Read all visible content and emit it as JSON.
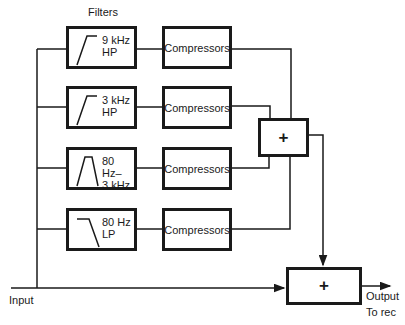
{
  "title": "Filters",
  "filters": [
    {
      "line1": "9 kHz",
      "line2": "HP",
      "shape": "highpass-icon"
    },
    {
      "line1": "3 kHz",
      "line2": "HP",
      "shape": "highpass-icon"
    },
    {
      "line1": "80 Hz–",
      "line2": "3 kHz",
      "shape": "bandpass-icon"
    },
    {
      "line1": "80 Hz",
      "line2": "LP",
      "shape": "lowpass-icon"
    }
  ],
  "compressors": [
    "Compressors",
    "Compressors",
    "Compressors",
    "Compressors"
  ],
  "sum_symbol": "+",
  "output_sum_symbol": "+",
  "input_label": "Input",
  "output_label": "Output",
  "output_sublabel": "To rec"
}
